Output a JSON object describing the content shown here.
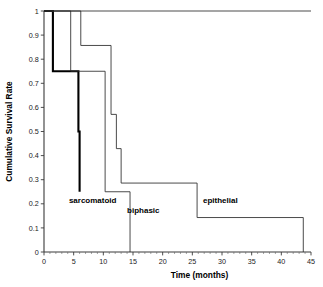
{
  "chart_data": {
    "type": "line",
    "title": "",
    "subtitle": "",
    "xlabel": "Time (months)",
    "ylabel": "Cumulative Survival Rate",
    "xlim": [
      0,
      45
    ],
    "ylim": [
      0,
      1
    ],
    "grid": false,
    "legend_position": "inline-annotations",
    "xticks": [
      "0",
      "5",
      "10",
      "15",
      "20",
      "25",
      "30",
      "35",
      "40",
      "45"
    ],
    "xtick_values": [
      0,
      5,
      10,
      15,
      20,
      25,
      30,
      35,
      40,
      45
    ],
    "yticks": [
      "0",
      "0.1",
      "0.2",
      "0.3",
      "0.4",
      "0.5",
      "0.6",
      "0.7",
      "0.8",
      "0.9",
      "1"
    ],
    "ytick_values": [
      0,
      0.1,
      0.2,
      0.3,
      0.4,
      0.5,
      0.6,
      0.7,
      0.8,
      0.9,
      1.0
    ],
    "plot_kind": "kaplan-meier-step",
    "series": [
      {
        "name": "sarcomatoid",
        "style": "bold",
        "label": "sarcomatoid",
        "label_x": 4.2,
        "label_y": 0.205,
        "x": [
          0,
          1.5,
          1.5,
          5.0,
          5.0,
          5.8,
          5.8,
          6.0,
          6.0
        ],
        "y": [
          1.0,
          1.0,
          0.75,
          0.75,
          0.75,
          0.75,
          0.5,
          0.5,
          0.25
        ],
        "steps": [
          {
            "time": 0.0,
            "survival": 1.0
          },
          {
            "time": 1.5,
            "survival": 0.75
          },
          {
            "time": 5.8,
            "survival": 0.5
          },
          {
            "time": 6.0,
            "survival": 0.25
          }
        ]
      },
      {
        "name": "biphasic",
        "style": "thin",
        "label": "biphasic",
        "label_x": 14.0,
        "label_y": 0.16,
        "x": [
          0,
          4.5,
          4.5,
          10.3,
          10.3,
          14.5,
          14.5
        ],
        "y": [
          1.0,
          1.0,
          0.75,
          0.75,
          0.25,
          0.25,
          0.0
        ],
        "steps": [
          {
            "time": 0.0,
            "survival": 1.0
          },
          {
            "time": 4.5,
            "survival": 0.75
          },
          {
            "time": 10.3,
            "survival": 0.25
          },
          {
            "time": 14.5,
            "survival": 0.0
          }
        ]
      },
      {
        "name": "epithelial",
        "style": "thin",
        "label": "epithelial",
        "label_x": 26.8,
        "label_y": 0.205,
        "x": [
          0,
          6.2,
          6.2,
          11.3,
          11.3,
          12.2,
          12.2,
          13.0,
          13.0,
          25.8,
          25.8,
          43.7,
          43.7
        ],
        "y": [
          1.0,
          1.0,
          0.857,
          0.857,
          0.571,
          0.571,
          0.429,
          0.429,
          0.286,
          0.286,
          0.143,
          0.143,
          0.0
        ],
        "steps": [
          {
            "time": 0.0,
            "survival": 1.0
          },
          {
            "time": 6.2,
            "survival": 0.857
          },
          {
            "time": 11.3,
            "survival": 0.571
          },
          {
            "time": 12.2,
            "survival": 0.429
          },
          {
            "time": 13.0,
            "survival": 0.286
          },
          {
            "time": 25.8,
            "survival": 0.143
          },
          {
            "time": 43.7,
            "survival": 0.0
          }
        ]
      },
      {
        "name": "top-baseline",
        "style": "thin",
        "label": "",
        "x": [
          0,
          45
        ],
        "y": [
          1.0,
          1.0
        ],
        "steps": []
      }
    ]
  },
  "colors": {
    "axis": "#3a3a3a",
    "curve_thin": "#2b2b2b",
    "curve_bold": "#000000",
    "background": "#ffffff",
    "text": "#000000"
  }
}
